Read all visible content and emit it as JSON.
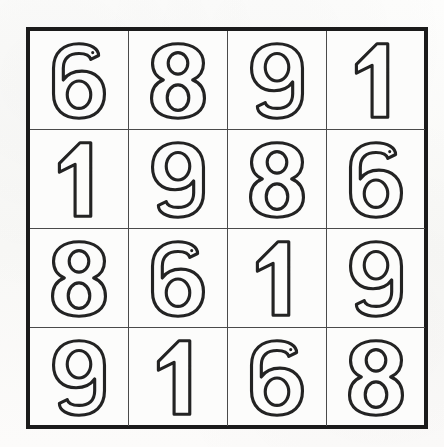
{
  "page": {
    "kind": "number-puzzle-grid",
    "title": "4x4 Number Grid Puzzle",
    "background_color": "#fbfbfa",
    "border_color": "#1b1b1b",
    "gridline_color": "#4a4a4a",
    "digit_stroke_color": "#232323",
    "digit_style": "hollow-outline"
  },
  "grid": {
    "rows": 4,
    "columns": 4,
    "outer_border_width_px": 4,
    "inner_line_width_px": 2,
    "cells": [
      {
        "row": 1,
        "col": 1,
        "value": "6"
      },
      {
        "row": 1,
        "col": 2,
        "value": "8"
      },
      {
        "row": 1,
        "col": 3,
        "value": "9"
      },
      {
        "row": 1,
        "col": 4,
        "value": "1"
      },
      {
        "row": 2,
        "col": 1,
        "value": "1"
      },
      {
        "row": 2,
        "col": 2,
        "value": "9"
      },
      {
        "row": 2,
        "col": 3,
        "value": "8"
      },
      {
        "row": 2,
        "col": 4,
        "value": "6"
      },
      {
        "row": 3,
        "col": 1,
        "value": "8"
      },
      {
        "row": 3,
        "col": 2,
        "value": "6"
      },
      {
        "row": 3,
        "col": 3,
        "value": "1"
      },
      {
        "row": 3,
        "col": 4,
        "value": "9"
      },
      {
        "row": 4,
        "col": 1,
        "value": "9"
      },
      {
        "row": 4,
        "col": 2,
        "value": "1"
      },
      {
        "row": 4,
        "col": 3,
        "value": "6"
      },
      {
        "row": 4,
        "col": 4,
        "value": "8"
      }
    ],
    "rows_as_text": [
      "6 8 9 1",
      "1 9 8 6",
      "8 6 1 9",
      "9 1 6 8"
    ]
  }
}
